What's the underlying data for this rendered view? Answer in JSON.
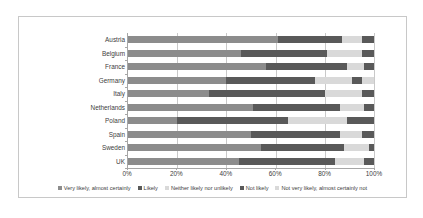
{
  "chart_data": {
    "type": "bar",
    "orientation": "horizontal",
    "stacked": true,
    "title": "",
    "xlabel": "",
    "ylabel": "",
    "xlim": [
      0,
      100
    ],
    "grid": true,
    "legend_position": "bottom",
    "xticks": [
      "0%",
      "20%",
      "40%",
      "60%",
      "80%",
      "100%"
    ],
    "xtick_values": [
      0,
      20,
      40,
      60,
      80,
      100
    ],
    "categories": [
      "Austria",
      "Belgium",
      "France",
      "Germany",
      "Italy",
      "Netherlands",
      "Poland",
      "Spain",
      "Sweden",
      "UK"
    ],
    "series": [
      {
        "name": "Very likely, almost certainly",
        "color": "#8c8c8c",
        "values": [
          61,
          46,
          56,
          40,
          33,
          51,
          20,
          50,
          54,
          45
        ]
      },
      {
        "name": "Likely",
        "color": "#595959",
        "values": [
          26,
          35,
          33,
          36,
          47,
          35,
          45,
          36,
          34,
          39
        ]
      },
      {
        "name": "Neither likely nor unlikely",
        "color": "#d9d9d9",
        "values": [
          8,
          14,
          7,
          15,
          15,
          10,
          24,
          9,
          10,
          12
        ]
      },
      {
        "name": "Not likely",
        "color": "#595959",
        "values": [
          5,
          5,
          4,
          4,
          5,
          4,
          11,
          5,
          2,
          4
        ]
      },
      {
        "name": "Not very likely, almost certainly not",
        "color": "#d9d9d9",
        "values": [
          0,
          0,
          0,
          5,
          0,
          0,
          0,
          0,
          0,
          0
        ]
      }
    ]
  },
  "legend": {
    "items": [
      "Very likely, almost certainly",
      "Likely",
      "Neither likely nor unlikely",
      "Not likely",
      "Not very likely, almost certainly not"
    ]
  }
}
